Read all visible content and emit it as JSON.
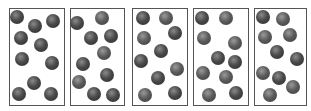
{
  "diagram": {
    "colors": {
      "border": "#555555",
      "particle_dark": "#2a2a2a",
      "particle_mid": "#4a4a4a",
      "background": "#ffffff"
    },
    "boxes": [
      {
        "x": 9,
        "y": 8,
        "w": 56,
        "h": 98,
        "particles": [
          [
            17,
            17,
            "d"
          ],
          [
            35,
            26,
            "d"
          ],
          [
            53,
            21,
            "d"
          ],
          [
            21,
            38,
            "d"
          ],
          [
            41,
            45,
            "d"
          ],
          [
            22,
            59,
            "d"
          ],
          [
            52,
            63,
            "d"
          ],
          [
            34,
            83,
            "d"
          ],
          [
            19,
            94,
            "d"
          ],
          [
            51,
            94,
            "d"
          ]
        ]
      },
      {
        "x": 70,
        "y": 8,
        "w": 55,
        "h": 98,
        "particles": [
          [
            77,
            23,
            "d"
          ],
          [
            102,
            18,
            "l"
          ],
          [
            91,
            38,
            "d"
          ],
          [
            111,
            36,
            "d"
          ],
          [
            104,
            53,
            "l"
          ],
          [
            83,
            64,
            "d"
          ],
          [
            107,
            75,
            "d"
          ],
          [
            79,
            82,
            "l"
          ],
          [
            94,
            94,
            "d"
          ],
          [
            113,
            95,
            "d"
          ]
        ]
      },
      {
        "x": 132,
        "y": 8,
        "w": 56,
        "h": 98,
        "particles": [
          [
            143,
            18,
            "d"
          ],
          [
            166,
            18,
            "l"
          ],
          [
            144,
            38,
            "l"
          ],
          [
            175,
            33,
            "d"
          ],
          [
            161,
            51,
            "d"
          ],
          [
            141,
            61,
            "d"
          ],
          [
            177,
            69,
            "l"
          ],
          [
            158,
            78,
            "d"
          ],
          [
            145,
            95,
            "l"
          ],
          [
            175,
            93,
            "d"
          ]
        ]
      },
      {
        "x": 193,
        "y": 8,
        "w": 56,
        "h": 98,
        "particles": [
          [
            202,
            18,
            "d"
          ],
          [
            226,
            18,
            "l"
          ],
          [
            204,
            38,
            "l"
          ],
          [
            235,
            43,
            "l"
          ],
          [
            218,
            58,
            "d"
          ],
          [
            235,
            62,
            "d"
          ],
          [
            203,
            73,
            "l"
          ],
          [
            226,
            77,
            "l"
          ],
          [
            209,
            95,
            "l"
          ],
          [
            236,
            93,
            "d"
          ]
        ]
      },
      {
        "x": 254,
        "y": 8,
        "w": 53,
        "h": 98,
        "particles": [
          [
            263,
            17,
            "d"
          ],
          [
            283,
            19,
            "l"
          ],
          [
            265,
            37,
            "l"
          ],
          [
            290,
            35,
            "l"
          ],
          [
            277,
            52,
            "d"
          ],
          [
            297,
            59,
            "d"
          ],
          [
            263,
            73,
            "l"
          ],
          [
            279,
            78,
            "d"
          ],
          [
            293,
            87,
            "l"
          ],
          [
            270,
            95,
            "l"
          ]
        ]
      }
    ]
  }
}
